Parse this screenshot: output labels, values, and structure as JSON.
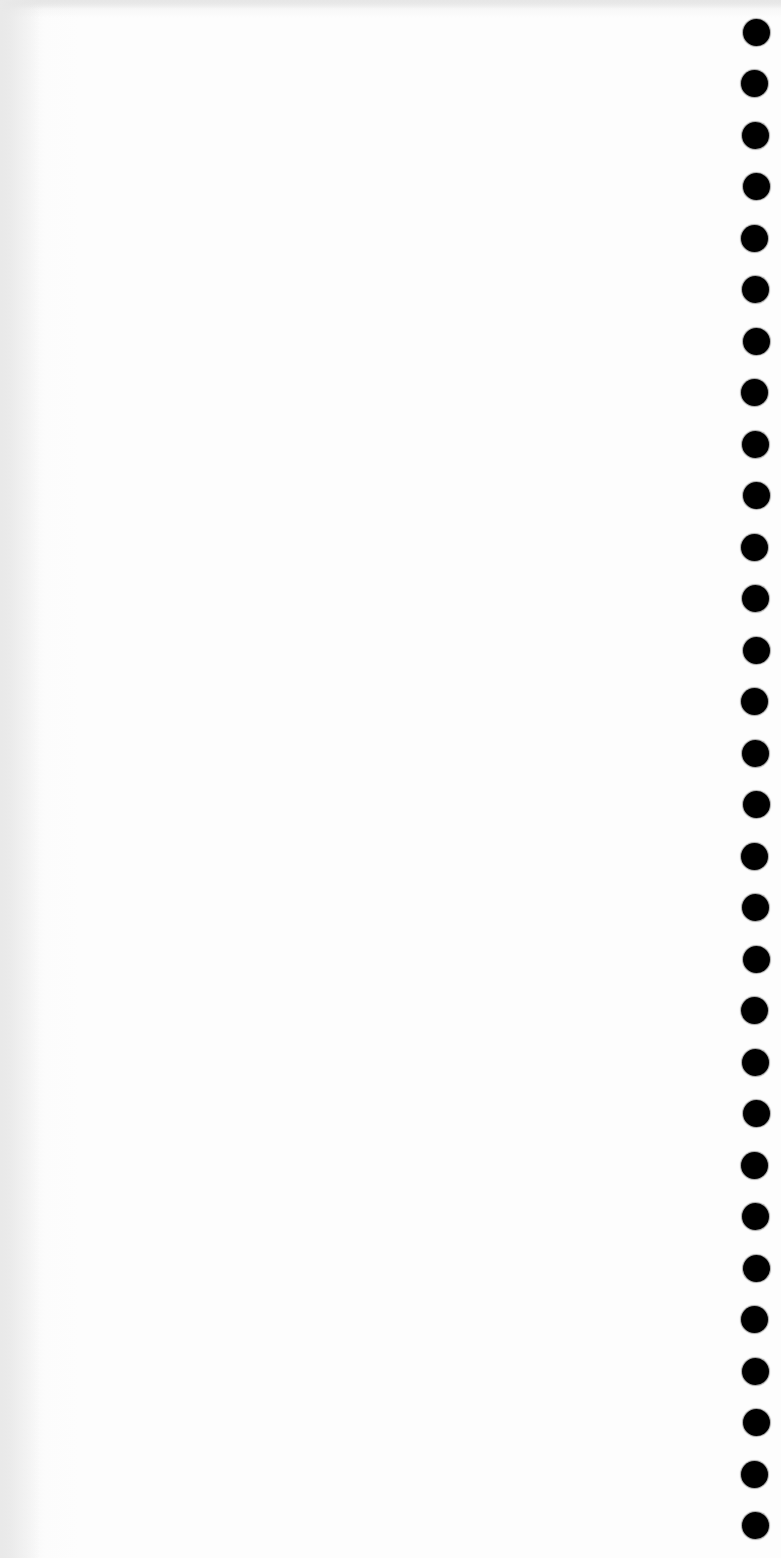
{
  "document": {
    "type": "blank scanned page",
    "text": "",
    "background_color": "#fefefe",
    "edge_shadow_color": "#e9e9e9"
  },
  "binding_holes": {
    "count": 30,
    "color": "#000000",
    "diameter_px": 27,
    "center_x_px": 755,
    "first_center_y_px": 32,
    "spacing_px": 51.5
  }
}
